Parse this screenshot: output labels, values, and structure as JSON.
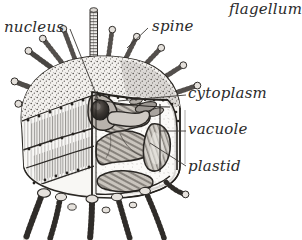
{
  "figure": {
    "kind": "scientific-illustration",
    "style": "vintage engraving / stipple and hatch line art",
    "background_color": "#ffffff",
    "ink_color": "#2b2b2b",
    "width": 302,
    "height": 240
  },
  "labels": {
    "nucleus": "nucleus",
    "spine": "spine",
    "flagellum": "flagellum",
    "cytoplasm": "cytoplasm",
    "vacuole": "vacuole",
    "plastid": "plastid"
  },
  "parts": {
    "flagellum_icon": "flagellum-shaft",
    "spine_icon": "spine-club",
    "nucleus_icon": "nucleus-blob",
    "vacuole_icon": "vacuole-oval",
    "plastid_icon": "plastid-band",
    "cytoplasm_icon": "cytoplasm-stipple",
    "girdle_icon": "girdle-band",
    "leg_icon": "basal-leg"
  }
}
